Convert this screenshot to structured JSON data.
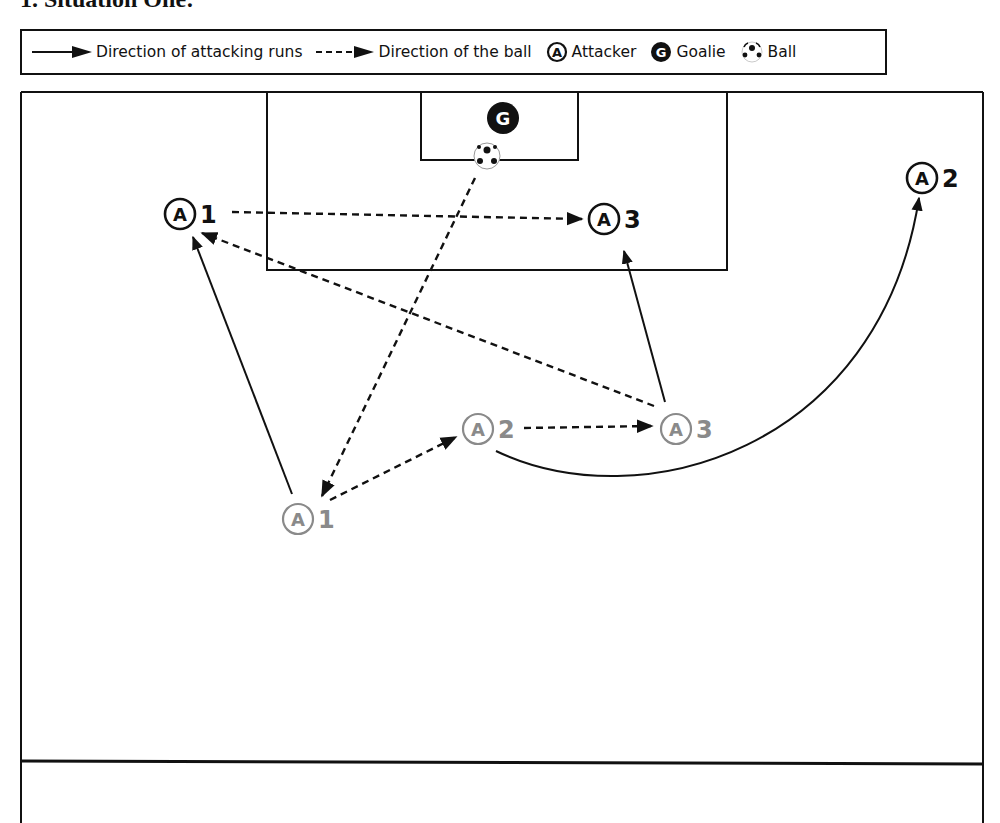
{
  "title": "1. Situation One:",
  "legend": {
    "items": [
      {
        "icon": "solid-arrow",
        "label": "Direction of attacking runs"
      },
      {
        "icon": "dashed-arrow",
        "label": "Direction of the ball"
      },
      {
        "icon": "attacker-circle",
        "glyph": "A",
        "label": "Attacker"
      },
      {
        "icon": "goalie-circle",
        "glyph": "G",
        "label": "Goalie"
      },
      {
        "icon": "soccer-ball",
        "label": "Ball"
      }
    ]
  },
  "field": {
    "goalie": {
      "glyph": "G",
      "x": 503,
      "y": 118
    },
    "ball": {
      "x": 487,
      "y": 156
    },
    "players_final": [
      {
        "glyph": "A",
        "number": "1",
        "x": 180,
        "y": 214
      },
      {
        "glyph": "A",
        "number": "3",
        "x": 604,
        "y": 219
      },
      {
        "glyph": "A",
        "number": "2",
        "x": 922,
        "y": 178
      }
    ],
    "players_start": [
      {
        "glyph": "A",
        "number": "1",
        "x": 298,
        "y": 519
      },
      {
        "glyph": "A",
        "number": "2",
        "x": 478,
        "y": 429
      },
      {
        "glyph": "A",
        "number": "3",
        "x": 676,
        "y": 429
      }
    ],
    "colors": {
      "line": "#111111",
      "start_player": "#8a8a8a",
      "goalie_fill": "#111111"
    }
  }
}
